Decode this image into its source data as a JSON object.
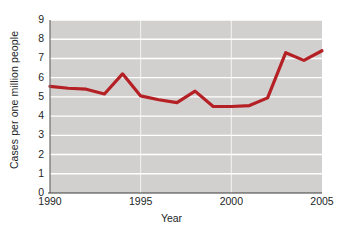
{
  "chart_data": {
    "type": "line",
    "title": "",
    "xlabel": "Year",
    "ylabel": "Cases per one million people",
    "x": [
      1990,
      1991,
      1992,
      1993,
      1994,
      1995,
      1996,
      1997,
      1998,
      1999,
      2000,
      2001,
      2002,
      2003,
      2004,
      2005
    ],
    "values": [
      5.55,
      5.45,
      5.4,
      5.15,
      6.2,
      5.05,
      4.85,
      4.7,
      5.3,
      4.5,
      4.5,
      4.55,
      4.95,
      7.3,
      6.9,
      7.4
    ],
    "series": [
      {
        "name": "Cases per one million people",
        "values": [
          5.55,
          5.45,
          5.4,
          5.15,
          6.2,
          5.05,
          4.85,
          4.7,
          5.3,
          4.5,
          4.5,
          4.55,
          4.95,
          7.3,
          6.9,
          7.4
        ]
      }
    ],
    "xlim": [
      1990,
      2005
    ],
    "ylim": [
      0,
      9
    ],
    "x_tick_labels": [
      "1990",
      "1995",
      "2000",
      "2005"
    ],
    "x_tick_values": [
      1990,
      1995,
      2000,
      2005
    ],
    "y_tick_labels": [
      "0",
      "1",
      "2",
      "3",
      "4",
      "5",
      "6",
      "7",
      "8",
      "9"
    ],
    "y_tick_values": [
      0,
      1,
      2,
      3,
      4,
      5,
      6,
      7,
      8,
      9
    ],
    "grid": "horizontal-white-major",
    "legend": "none",
    "line_color": "#b52025",
    "plot_background": "#d2d0ce",
    "gridline_color": "#ffffff",
    "axis_color": "#6e6b69",
    "line_width": 3.2
  }
}
